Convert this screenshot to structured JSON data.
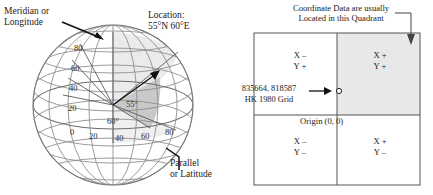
{
  "globe": {
    "meridian_label": "Meridian or\nLongitude",
    "location_label": "Location:\n55°N 60°E",
    "parallel_label": "Parallel\nor Latitude",
    "latitude_ticks": [
      "80",
      "60",
      "40",
      "20",
      "0"
    ],
    "longitude_ticks": [
      "0",
      "20",
      "40",
      "60",
      "80"
    ],
    "latitude_angle_label": "55°",
    "longitude_angle_label": "60°"
  },
  "grid": {
    "caption": "Coordinate Data are usually\nLocated in this Quadrant",
    "origin_label": "Origin (0, 0)",
    "coordinate_value": "835664, 818587",
    "coordinate_system": "HK 1980 Grid",
    "quadrants": [
      {
        "name": "upper-left",
        "x_sign": "X –",
        "y_sign": "Y +"
      },
      {
        "name": "upper-right",
        "x_sign": "X +",
        "y_sign": "Y +"
      },
      {
        "name": "lower-left",
        "x_sign": "X –",
        "y_sign": "Y –"
      },
      {
        "name": "lower-right",
        "x_sign": "X +",
        "y_sign": "Y –"
      }
    ],
    "highlight_color": "#e8e8e8",
    "border_color": "#555555"
  }
}
